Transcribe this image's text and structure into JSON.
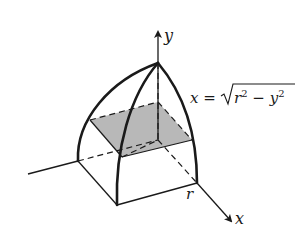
{
  "diagram": {
    "axes": {
      "y_label": "y",
      "x_label": "x"
    },
    "equation": {
      "lhs": "x = ",
      "radicand_r": "r",
      "radicand_exp1": "2",
      "radicand_minus": " − ",
      "radicand_y": "y",
      "radicand_exp2": "2"
    },
    "point_label_r": "r",
    "colors": {
      "stroke": "#1a1a1a",
      "cross_section_fill": "#b8b8b8",
      "background": "#ffffff"
    }
  }
}
